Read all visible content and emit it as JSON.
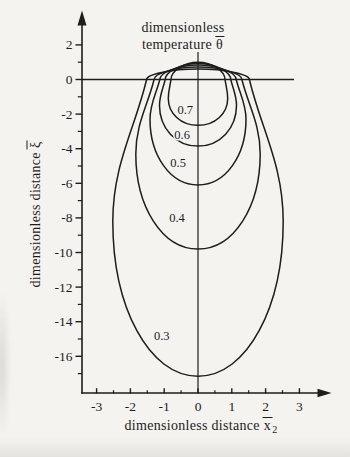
{
  "figure": {
    "bg_color": "#f4f3f0",
    "line_color": "#1d1d1b",
    "title": {
      "line1": "dimensionless",
      "line2_text": "temperature",
      "line2_symbol": "θ"
    },
    "y_axis_label": {
      "text": "dimensionless distance",
      "symbol": "ξ"
    },
    "x_axis_label": {
      "text": "dimensionless distance",
      "symbol": "x",
      "subscript": "2"
    }
  },
  "chart_data": {
    "type": "contour",
    "xlabel": "dimensionless distance x̄2",
    "ylabel": "dimensionless distance ξ̄",
    "xlim": [
      -3.4,
      3.9
    ],
    "ylim": [
      -18.1,
      3.9
    ],
    "grid": false,
    "x_ticks_major": [
      -3,
      -2,
      -1,
      0,
      1,
      2,
      3
    ],
    "x_ticks_minor": [
      -2.5,
      -1.5,
      -0.5,
      0.5,
      1.5,
      2.5
    ],
    "y_ticks_major": [
      2,
      0,
      -2,
      -4,
      -6,
      -8,
      -10,
      -12,
      -14,
      -16
    ],
    "y_ticks_minor": [
      1,
      -1,
      -3,
      -5,
      -7,
      -9,
      -11,
      -13,
      -15,
      -17
    ],
    "surface_line_xi": 0,
    "axis_of_symmetry_x": 0,
    "contours": [
      {
        "value": 0.7,
        "label": "0.7",
        "peak_xi": 1.0,
        "halfwidth_at_surface": 0.8,
        "max_halfwidth": 0.88,
        "xi_at_max_halfwidth": -1.1,
        "bottom_xi": -2.65,
        "label_x": -0.38,
        "label_xi": -1.75
      },
      {
        "value": 0.6,
        "label": "0.6",
        "peak_xi": 0.92,
        "halfwidth_at_surface": 0.97,
        "max_halfwidth": 1.14,
        "xi_at_max_halfwidth": -1.5,
        "bottom_xi": -3.85,
        "label_x": -0.47,
        "label_xi": -3.18
      },
      {
        "value": 0.5,
        "label": "0.5",
        "peak_xi": 0.83,
        "halfwidth_at_surface": 1.13,
        "max_halfwidth": 1.42,
        "xi_at_max_halfwidth": -2.3,
        "bottom_xi": -6.1,
        "label_x": -0.59,
        "label_xi": -4.8
      },
      {
        "value": 0.4,
        "label": "0.4",
        "peak_xi": 0.72,
        "halfwidth_at_surface": 1.3,
        "max_halfwidth": 1.84,
        "xi_at_max_halfwidth": -4.3,
        "bottom_xi": -9.8,
        "label_x": -0.62,
        "label_xi": -7.98
      },
      {
        "value": 0.3,
        "label": "0.3",
        "peak_xi": 0.6,
        "halfwidth_at_surface": 1.52,
        "max_halfwidth": 2.52,
        "xi_at_max_halfwidth": -8.2,
        "bottom_xi": -17.15,
        "label_x": -1.07,
        "label_xi": -14.8
      }
    ]
  }
}
